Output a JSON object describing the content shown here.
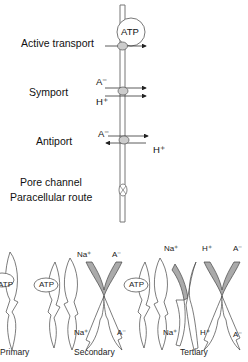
{
  "top_panel": {
    "labels": {
      "active_transport": "Active transport",
      "symport": "Symport",
      "antiport": "Antiport",
      "pore_channel": "Pore channel",
      "paracellular_route": "Paracellular route"
    },
    "atp_label": "ATP",
    "symport_ions": {
      "top": "A⁻",
      "bottom": "H⁺"
    },
    "antiport_ions": {
      "left": "A⁻",
      "right": "H⁺"
    }
  },
  "bottom_panel": {
    "captions": {
      "primary": "Primary",
      "secondary": "Secondary",
      "tertiary": "Tertiary"
    },
    "primary": {
      "atp": "ATP"
    },
    "secondary": {
      "atp": "ATP",
      "na_top": "Na⁺",
      "a_top": "A⁻",
      "na_bottom": "Na⁺",
      "a_bottom": "A⁻"
    },
    "tertiary": {
      "atp": "ATP",
      "na_top": "Na⁺",
      "h_top": "H⁺",
      "a_top": "A⁻",
      "na_bottom": "Na⁺",
      "h_bottom": "H⁺",
      "a_bottom": "A⁻"
    }
  },
  "colors": {
    "line": "#333333",
    "fill_gray": "#aaaaaa",
    "membrane": "#777777"
  }
}
